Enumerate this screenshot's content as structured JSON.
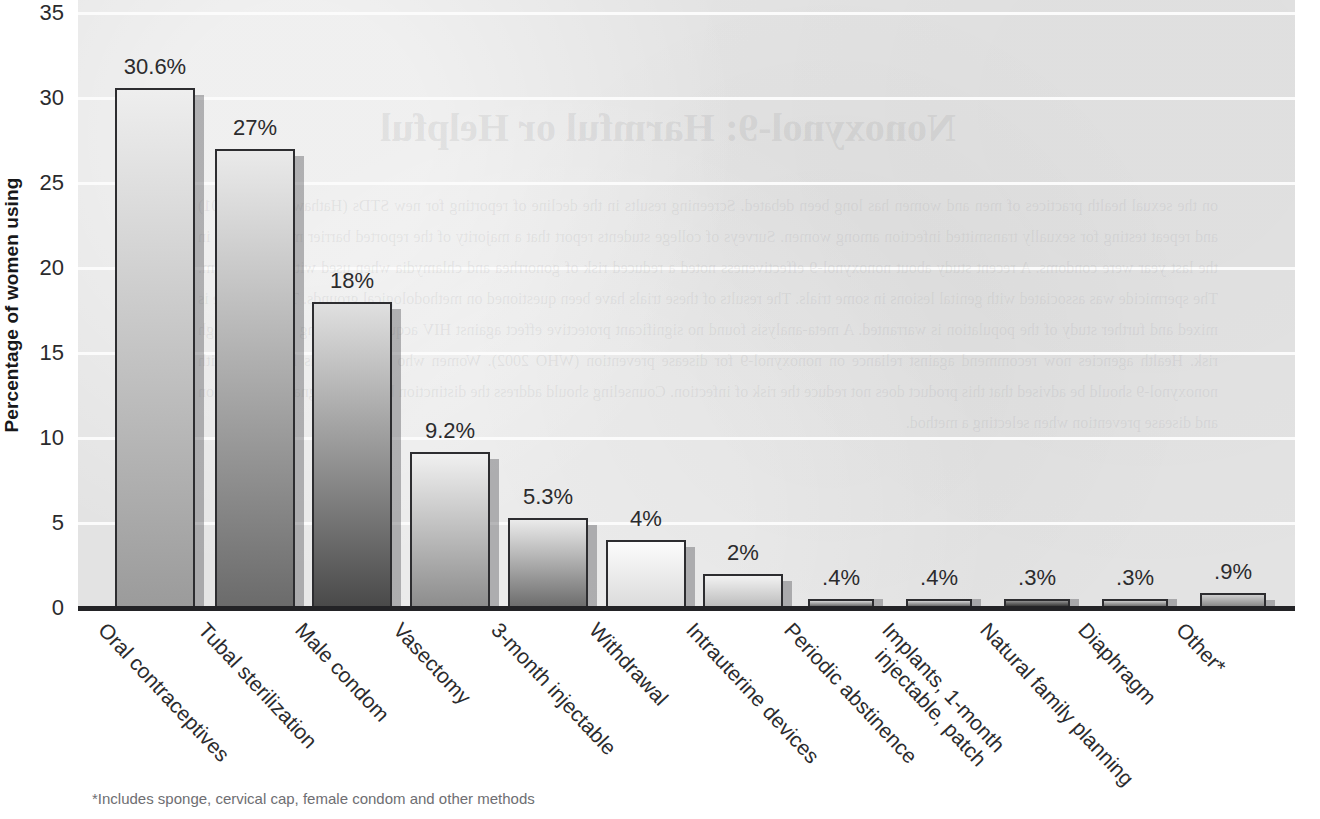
{
  "chart_data": {
    "type": "bar",
    "title": "",
    "xlabel": "",
    "ylabel": "Percentage of women using",
    "ylim": [
      0,
      35
    ],
    "yticks": [
      0,
      5,
      10,
      15,
      20,
      25,
      30,
      35
    ],
    "ytick_labels": [
      "0",
      "5",
      "10",
      "15",
      "20",
      "25",
      "30",
      "35"
    ],
    "grid": "horizontal-white",
    "legend": "none",
    "categories": [
      "Oral contraceptives",
      "Tubal sterilization",
      "Male condom",
      "Vasectomy",
      "3-month injectable",
      "Withdrawal",
      "Intrauterine devices",
      "Periodic abstinence",
      "Implants, 1-month injectable, patch",
      "Natural family planning",
      "Diaphragm",
      "Other*"
    ],
    "values": [
      30.6,
      27,
      18,
      9.2,
      5.3,
      4,
      2,
      0.4,
      0.4,
      0.3,
      0.3,
      0.9
    ],
    "value_labels": [
      "30.6%",
      "27%",
      "18%",
      "9.2%",
      "5.3%",
      "4%",
      "2%",
      ".4%",
      ".4%",
      ".3%",
      ".3%",
      ".9%"
    ],
    "annotations": [
      "*Includes sponge, cervical cap, female condom and other methods"
    ]
  },
  "axis": {
    "y_title": "Percentage of women using"
  },
  "category_lines": [
    [
      "Oral contraceptives"
    ],
    [
      "Tubal sterilization"
    ],
    [
      "Male condom"
    ],
    [
      "Vasectomy"
    ],
    [
      "3-month injectable"
    ],
    [
      "Withdrawal"
    ],
    [
      "Intrauterine devices"
    ],
    [
      "Periodic abstinence"
    ],
    [
      "Implants, 1-month",
      "injectable, patch"
    ],
    [
      "Natural family planning"
    ],
    [
      "Diaphragm"
    ],
    [
      "Other*"
    ]
  ],
  "footnote": "*Includes sponge, cervical cap, female condom and other methods",
  "bleed_through": {
    "title": "Nonoxynol-9: Harmful or Helpful",
    "body": "on the sexual health practices of men and women has long been debated. Screening results in the decline of reporting for new STDs (Hathaway et al. 2001) and repeat testing for sexually transmitted infection among women. Surveys of college students report that a majority of the reported barrier methods used in the last year were condoms. A recent study about nonoxynol-9 effectiveness noted a reduced risk of gonorrhea and chlamydia when used with a diaphragm. The spermicide was associated with genital lesions in some trials. The results of these trials have been questioned on methodological grounds. The evidence is mixed and further study of the population is warranted. A meta-analysis found no significant protective effect against HIV acquisition among women at high risk. Health agencies now recommend against reliance on nonoxynol-9 for disease prevention (WHO 2002). Women who use condoms lubricated with nonoxynol-9 should be advised that this product does not reduce the risk of infection. Counseling should address the distinction between pregnancy prevention and disease prevention when selecting a method.",
    "note": "faint mirrored text bleeding through from the reverse side of the printed page"
  },
  "colors": {
    "plot_background": "#e3e3e3",
    "gridline": "#fbfbfb",
    "axis_line": "#232326",
    "bar_outline": "#2d2d30",
    "text": "#2b2b2d",
    "footnote_text": "#6e6e72",
    "page_background": "#ffffff"
  },
  "bar_styles": [
    {
      "top": "#eeeeee",
      "bottom": "#9b9b9b"
    },
    {
      "top": "#eaeaea",
      "bottom": "#6b6b6b"
    },
    {
      "top": "#e0e0e0",
      "bottom": "#4a4a4a"
    },
    {
      "top": "#f0f0f0",
      "bottom": "#8d8d8d"
    },
    {
      "top": "#eaeaea",
      "bottom": "#6e6e6e"
    },
    {
      "top": "#fcfcfc",
      "bottom": "#dcdcdc"
    },
    {
      "top": "#f2f2f2",
      "bottom": "#bdbdbd"
    },
    {
      "top": "#d5d5d5",
      "bottom": "#6d6d6d"
    },
    {
      "top": "#d2d2d2",
      "bottom": "#6a6a6a"
    },
    {
      "top": "#8f8f8f",
      "bottom": "#3a3a3a"
    },
    {
      "top": "#c9c9c9",
      "bottom": "#707070"
    },
    {
      "top": "#cfcfcf",
      "bottom": "#8a8a8a"
    }
  ]
}
